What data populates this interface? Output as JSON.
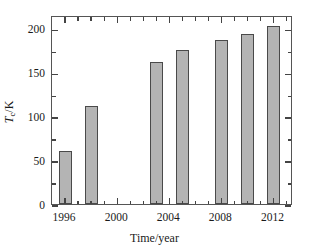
{
  "chart_data": {
    "type": "bar",
    "title": "",
    "xlabel": "Time/year",
    "ylabel": "Tc/K",
    "ylabel_parts": {
      "symbol": "T",
      "subscript": "c",
      "unit": "/K"
    },
    "categories": [
      1996,
      1998,
      2003,
      2005,
      2008,
      2010,
      2012
    ],
    "values": [
      60,
      111,
      162,
      175,
      187,
      193,
      203
    ],
    "xlim": [
      1995.0,
      2013.5
    ],
    "ylim": [
      0,
      215
    ],
    "xticks": [
      1996,
      2000,
      2004,
      2008,
      2012
    ],
    "xtick_labels": [
      "1996",
      "2000",
      "2004",
      "2008",
      "2012"
    ],
    "x_minor_ticks": [
      1997,
      1998,
      1999,
      2001,
      2002,
      2003,
      2005,
      2006,
      2007,
      2009,
      2010,
      2011,
      2013
    ],
    "yticks": [
      0,
      50,
      100,
      150,
      200
    ],
    "ytick_labels": [
      "0",
      "50",
      "100",
      "150",
      "200"
    ],
    "y_minor_ticks": [
      25,
      75,
      125,
      175
    ],
    "grid": false,
    "legend": null,
    "bar_fill_color": "#b4b4b4",
    "bar_edge_color": "#4a4a4a",
    "axis_color": "#555555",
    "background_color": "#ffffff",
    "bar_width_years": 1.0
  }
}
